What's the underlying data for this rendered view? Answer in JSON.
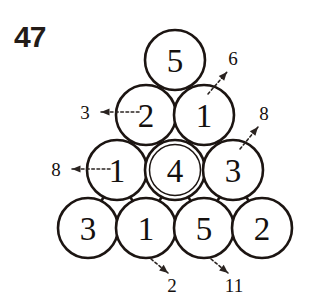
{
  "page": {
    "title": "47",
    "background_color": "#ffffff",
    "ink_color": "#1c1512"
  },
  "puzzle": {
    "kind": "triangular-circle-grid",
    "rows": 4,
    "highlighted_cell": "r3c2",
    "cells": [
      {
        "id": "r1c1",
        "value": "5",
        "row": 1,
        "col": 1,
        "cx": 175,
        "cy": 60,
        "r": 30,
        "highlighted": false
      },
      {
        "id": "r2c1",
        "value": "2",
        "row": 2,
        "col": 1,
        "cx": 146,
        "cy": 115,
        "r": 30,
        "highlighted": false
      },
      {
        "id": "r2c2",
        "value": "1",
        "row": 2,
        "col": 2,
        "cx": 204,
        "cy": 115,
        "r": 30,
        "highlighted": false
      },
      {
        "id": "r3c1",
        "value": "1",
        "row": 3,
        "col": 1,
        "cx": 117,
        "cy": 170,
        "r": 30,
        "highlighted": false
      },
      {
        "id": "r3c2",
        "value": "4",
        "row": 3,
        "col": 2,
        "cx": 175,
        "cy": 170,
        "r": 30,
        "highlighted": true
      },
      {
        "id": "r3c3",
        "value": "3",
        "row": 3,
        "col": 3,
        "cx": 233,
        "cy": 170,
        "r": 30,
        "highlighted": false
      },
      {
        "id": "r4c1",
        "value": "3",
        "row": 4,
        "col": 1,
        "cx": 88,
        "cy": 228,
        "r": 30,
        "highlighted": false
      },
      {
        "id": "r4c2",
        "value": "1",
        "row": 4,
        "col": 2,
        "cx": 146,
        "cy": 228,
        "r": 30,
        "highlighted": false
      },
      {
        "id": "r4c3",
        "value": "5",
        "row": 4,
        "col": 3,
        "cx": 204,
        "cy": 228,
        "r": 30,
        "highlighted": false
      },
      {
        "id": "r4c4",
        "value": "2",
        "row": 4,
        "col": 4,
        "cx": 262,
        "cy": 228,
        "r": 30,
        "highlighted": false
      }
    ],
    "connectors": [
      {
        "from": "r1c1",
        "to": "r2c1"
      },
      {
        "from": "r1c1",
        "to": "r2c2"
      },
      {
        "from": "r2c1",
        "to": "r2c2"
      },
      {
        "from": "r2c1",
        "to": "r3c1"
      },
      {
        "from": "r2c1",
        "to": "r3c2"
      },
      {
        "from": "r2c2",
        "to": "r3c2"
      },
      {
        "from": "r2c2",
        "to": "r3c3"
      },
      {
        "from": "r3c1",
        "to": "r3c2"
      },
      {
        "from": "r3c2",
        "to": "r3c3"
      },
      {
        "from": "r3c1",
        "to": "r4c1"
      },
      {
        "from": "r3c1",
        "to": "r4c2"
      },
      {
        "from": "r3c2",
        "to": "r4c2"
      },
      {
        "from": "r3c2",
        "to": "r4c3"
      },
      {
        "from": "r3c3",
        "to": "r4c3"
      },
      {
        "from": "r3c3",
        "to": "r4c4"
      },
      {
        "from": "r4c1",
        "to": "r4c2"
      },
      {
        "from": "r4c2",
        "to": "r4c3"
      },
      {
        "from": "r4c3",
        "to": "r4c4"
      }
    ],
    "clues": [
      {
        "id": "clue-left-top",
        "value": "3",
        "direction": "left",
        "label_x": 85,
        "label_y": 112,
        "tail_x": 139,
        "tail_y": 112,
        "head_x": 101,
        "head_y": 112
      },
      {
        "id": "clue-left-middle",
        "value": "8",
        "direction": "left",
        "label_x": 56,
        "label_y": 169,
        "tail_x": 110,
        "tail_y": 169,
        "head_x": 72,
        "head_y": 169
      },
      {
        "id": "clue-upper-right-top",
        "value": "6",
        "direction": "up-right",
        "label_x": 233,
        "label_y": 58,
        "tail_x": 208,
        "tail_y": 94,
        "head_x": 227,
        "head_y": 72
      },
      {
        "id": "clue-upper-right-lower",
        "value": "8",
        "direction": "up-right",
        "label_x": 264,
        "label_y": 113,
        "tail_x": 240,
        "tail_y": 149,
        "head_x": 258,
        "head_y": 127
      },
      {
        "id": "clue-bottom-left",
        "value": "2",
        "direction": "down-right",
        "label_x": 172,
        "label_y": 285,
        "tail_x": 151,
        "tail_y": 259,
        "head_x": 168,
        "head_y": 273
      },
      {
        "id": "clue-bottom-right",
        "value": "11",
        "direction": "down-right",
        "label_x": 234,
        "label_y": 285,
        "tail_x": 211,
        "tail_y": 259,
        "head_x": 228,
        "head_y": 273
      }
    ]
  }
}
